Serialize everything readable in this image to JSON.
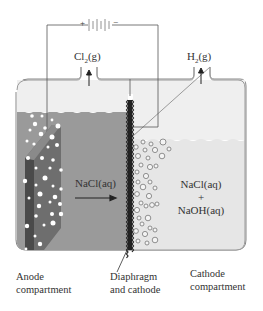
{
  "diagram": {
    "type": "chlor-alkali diaphragm electrolysis cell",
    "battery": {
      "positive": "+",
      "negative": "−"
    },
    "gases": {
      "anode_gas": {
        "formula": "Cl",
        "subscript": "2",
        "state": "(g)"
      },
      "cathode_gas": {
        "formula": "H",
        "subscript": "2",
        "state": "(g)"
      }
    },
    "solutions": {
      "anode_side": "NaCl(aq)",
      "cathode_side_line1": "NaCl(aq)",
      "cathode_side_plus": "+",
      "cathode_side_line2": "NaOH(aq)"
    },
    "labels": {
      "anode_line1": "Anode",
      "anode_line2": "compartment",
      "diaphragm_line1": "Diaphragm",
      "diaphragm_line2": "and cathode",
      "cathode_line1": "Cathode",
      "cathode_line2": "compartment"
    },
    "colors": {
      "anode_solution": "#9a9a9a",
      "cathode_solution": "#e6e6e6",
      "gas_space": "#efefef",
      "electrode": "#6e6e6e",
      "wire": "#555555"
    }
  }
}
